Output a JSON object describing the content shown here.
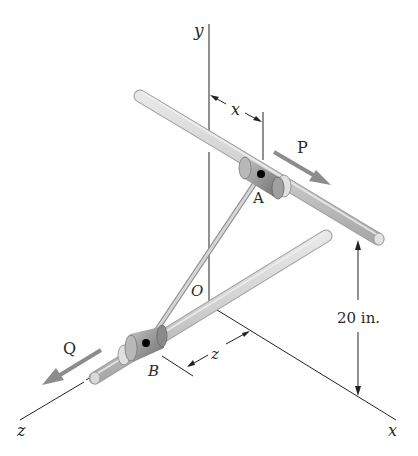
{
  "diagram": {
    "type": "3d-mechanism",
    "labels": {
      "y_axis": "y",
      "x_axis": "x",
      "z_axis": "z",
      "origin": "O",
      "collar_a": "A",
      "collar_b": "B",
      "force_p": "P",
      "force_q": "Q",
      "dim_x": "x",
      "dim_z": "z",
      "dim_height": "20 in."
    },
    "colors": {
      "rod": "#c8c8c8",
      "rod_highlight": "#ececec",
      "collar": "#9a9a9a",
      "arrow": "#8c8c8c",
      "line": "#222222"
    }
  }
}
